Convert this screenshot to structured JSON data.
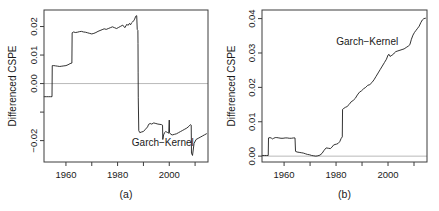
{
  "figure": {
    "background": "#ffffff",
    "line_color": "#1c1c1c",
    "frame_color": "#3c3c3c",
    "zeroline_color": "#b9b9b9"
  },
  "chart_data": [
    {
      "type": "line",
      "panel_id": "a",
      "caption": "(a)",
      "title": "",
      "xlabel": "",
      "ylabel": "Differenced CSPE",
      "series_label": "Garch-Kernel",
      "series_label_display": "Garch−Kernel",
      "grid": false,
      "legend_position": "inside-lower-right",
      "zero_reference_line": 0.0,
      "xlim": [
        1951.5,
        2015.0
      ],
      "ylim": [
        -0.0275,
        0.0258
      ],
      "xticks": [
        1960,
        1970,
        1980,
        1990,
        2000,
        2010
      ],
      "xtick_labels": [
        "1960",
        "",
        "1980",
        "",
        "2000",
        ""
      ],
      "yticks": [
        -0.02,
        -0.01,
        0.0,
        0.01,
        0.02
      ],
      "ytick_labels": [
        "-0.02",
        "",
        "0.00",
        "0.01",
        "0.02"
      ],
      "ytick_labels_display": [
        "−0.02",
        "",
        "0.00",
        "0.01",
        "0.02"
      ],
      "series": [
        {
          "name": "Garch-Kernel",
          "x": [
            1951.6,
            1952.4,
            1953.2,
            1954.0,
            1954.6,
            1954.7,
            1955.3,
            1956.0,
            1956.8,
            1957.6,
            1958.4,
            1959.2,
            1960.0,
            1960.8,
            1961.6,
            1962.3,
            1962.4,
            1963.0,
            1963.6,
            1964.4,
            1965.2,
            1966.0,
            1966.8,
            1967.6,
            1968.4,
            1969.2,
            1970.0,
            1970.8,
            1971.6,
            1972.4,
            1973.2,
            1974.0,
            1974.8,
            1975.6,
            1976.4,
            1977.2,
            1978.0,
            1978.8,
            1979.6,
            1980.4,
            1981.2,
            1982.0,
            1982.8,
            1983.2,
            1983.6,
            1984.0,
            1984.6,
            1985.0,
            1985.4,
            1985.8,
            1986.2,
            1986.6,
            1987.0,
            1987.4,
            1987.6,
            1987.75,
            1987.85,
            1987.9,
            1987.95,
            1988.0,
            1988.2,
            1988.6,
            1989.2,
            1990.0,
            1990.8,
            1991.6,
            1992.0,
            1992.6,
            1993.2,
            1994.0,
            1994.8,
            1995.6,
            1996.4,
            1997.0,
            1997.4,
            1997.5,
            1997.8,
            1998.2,
            1998.6,
            1999.0,
            1999.4,
            1999.8,
            2000.0,
            2000.1,
            2000.6,
            2001.2,
            2002.0,
            2002.8,
            2003.6,
            2004.4,
            2005.2,
            2006.0,
            2006.8,
            2007.6,
            2008.2,
            2008.5,
            2008.6,
            2009.0,
            2009.6,
            2010.4,
            2011.2,
            2012.0,
            2012.8,
            2013.6,
            2014.4
          ],
          "y": [
            -0.0046,
            -0.0046,
            -0.0046,
            -0.0046,
            -0.0046,
            0.0063,
            0.0063,
            0.0062,
            0.0061,
            0.006,
            0.0061,
            0.0062,
            0.0063,
            0.0066,
            0.007,
            0.0072,
            0.0178,
            0.0181,
            0.0179,
            0.018,
            0.0182,
            0.0183,
            0.0181,
            0.018,
            0.0178,
            0.0176,
            0.0174,
            0.0176,
            0.0179,
            0.0183,
            0.0186,
            0.0189,
            0.0192,
            0.019,
            0.0193,
            0.0196,
            0.0199,
            0.0196,
            0.0193,
            0.0197,
            0.0201,
            0.0205,
            0.0196,
            0.0202,
            0.0208,
            0.0204,
            0.0211,
            0.0206,
            0.0213,
            0.0216,
            0.022,
            0.0226,
            0.0236,
            0.0238,
            0.019,
            0.0188,
            0.0186,
            0.014,
            0.004,
            -0.005,
            -0.0165,
            -0.0172,
            -0.017,
            -0.0168,
            -0.016,
            -0.0152,
            -0.0143,
            -0.014,
            -0.0142,
            -0.0138,
            -0.014,
            -0.0142,
            -0.0143,
            -0.0144,
            -0.0146,
            -0.0196,
            -0.018,
            -0.0172,
            -0.0168,
            -0.017,
            -0.0172,
            -0.0174,
            -0.0128,
            -0.0172,
            -0.0178,
            -0.018,
            -0.0178,
            -0.0176,
            -0.0172,
            -0.0168,
            -0.0164,
            -0.016,
            -0.0156,
            -0.015,
            -0.0144,
            -0.0146,
            -0.0244,
            -0.0252,
            -0.021,
            -0.0196,
            -0.0192,
            -0.0188,
            -0.0184,
            -0.018,
            -0.0176,
            -0.0174
          ]
        }
      ]
    },
    {
      "type": "line",
      "panel_id": "b",
      "caption": "(b)",
      "title": "",
      "xlabel": "",
      "ylabel": "Differenced CSPE",
      "series_label": "Garch-Kernel",
      "series_label_display": "Garch−Kernel",
      "grid": false,
      "legend_position": "inside-upper-center",
      "zero_reference_line": 0.0,
      "xlim": [
        1951.5,
        2015.0
      ],
      "ylim": [
        -0.0017,
        0.0425
      ],
      "xticks": [
        1960,
        1970,
        1980,
        1990,
        2000,
        2010
      ],
      "xtick_labels": [
        "1960",
        "",
        "1980",
        "",
        "2000",
        ""
      ],
      "yticks": [
        0.0,
        0.01,
        0.02,
        0.03,
        0.04
      ],
      "ytick_labels": [
        "0.00",
        "0.01",
        "0.02",
        "0.03",
        "0.04"
      ],
      "series": [
        {
          "name": "Garch-Kernel",
          "x": [
            1951.6,
            1952.4,
            1953.2,
            1953.9,
            1954.0,
            1954.6,
            1955.2,
            1955.6,
            1956.0,
            1956.6,
            1957.2,
            1958.0,
            1958.8,
            1959.6,
            1960.4,
            1961.2,
            1962.0,
            1962.8,
            1963.6,
            1964.2,
            1964.4,
            1965.0,
            1965.8,
            1966.6,
            1967.4,
            1968.2,
            1969.0,
            1969.8,
            1970.6,
            1971.4,
            1972.2,
            1973.0,
            1973.8,
            1974.6,
            1975.4,
            1976.2,
            1977.0,
            1977.8,
            1978.4,
            1979.0,
            1979.6,
            1980.2,
            1980.8,
            1981.4,
            1982.0,
            1982.4,
            1982.5,
            1983.0,
            1983.6,
            1984.2,
            1985.0,
            1985.8,
            1986.6,
            1987.4,
            1988.2,
            1989.0,
            1989.8,
            1990.6,
            1991.4,
            1992.2,
            1993.0,
            1993.8,
            1994.6,
            1995.4,
            1996.2,
            1997.0,
            1997.8,
            1998.6,
            1999.4,
            2000.0,
            2000.4,
            2000.8,
            2001.2,
            2001.6,
            2002.0,
            2002.4,
            2003.0,
            2003.8,
            2004.6,
            2005.4,
            2006.2,
            2007.0,
            2007.8,
            2008.4,
            2009.0,
            2009.6,
            2010.2,
            2010.8,
            2011.4,
            2012.0,
            2012.6,
            2013.2,
            2013.8,
            2014.4
          ],
          "y": [
            0.0002,
            0.0002,
            0.0002,
            0.0002,
            0.0053,
            0.0054,
            0.0052,
            0.005,
            0.0052,
            0.0054,
            0.0054,
            0.0053,
            0.0052,
            0.0052,
            0.0053,
            0.0053,
            0.0052,
            0.0052,
            0.0053,
            0.0053,
            0.0014,
            0.0012,
            0.0011,
            0.001,
            0.0009,
            0.0007,
            0.0005,
            0.0004,
            0.0002,
            0.0001,
            0.0,
            0.0001,
            0.0003,
            0.0008,
            0.0017,
            0.0024,
            0.0023,
            0.0022,
            0.0026,
            0.0032,
            0.0034,
            0.0035,
            0.0037,
            0.0042,
            0.0052,
            0.0056,
            0.0136,
            0.0139,
            0.0142,
            0.0144,
            0.015,
            0.0158,
            0.0162,
            0.0168,
            0.0178,
            0.0186,
            0.019,
            0.0196,
            0.02,
            0.0206,
            0.0208,
            0.0214,
            0.0222,
            0.0232,
            0.0242,
            0.0252,
            0.0262,
            0.0272,
            0.0282,
            0.0294,
            0.0296,
            0.029,
            0.0292,
            0.0294,
            0.0296,
            0.03,
            0.0304,
            0.0306,
            0.0308,
            0.031,
            0.0312,
            0.0316,
            0.032,
            0.0324,
            0.034,
            0.0352,
            0.036,
            0.0366,
            0.0372,
            0.0378,
            0.0388,
            0.0396,
            0.04,
            0.0401
          ]
        }
      ]
    }
  ]
}
